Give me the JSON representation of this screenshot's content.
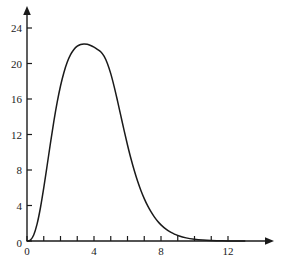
{
  "chart_data": {
    "type": "line",
    "title": "",
    "subtitle": "",
    "xlabel": "",
    "ylabel": "",
    "xlim": [
      0,
      13.5
    ],
    "ylim": [
      0,
      25.5
    ],
    "grid": false,
    "legend": null,
    "axis_style": {
      "x_axis_arrow": true,
      "y_axis_arrow": true,
      "spines": [
        "left",
        "bottom"
      ],
      "line_color": "#1a1a1a",
      "curve_color": "#1a1a1a",
      "background": "#ffffff"
    },
    "xticks": [
      0,
      1,
      2,
      3,
      4,
      5,
      6,
      7,
      8,
      9,
      10,
      11,
      12
    ],
    "xtick_labels": [
      "0",
      "",
      "",
      "",
      "4",
      "",
      "",
      "",
      "8",
      "",
      "",
      "",
      "12"
    ],
    "yticks": [
      0,
      4,
      8,
      12,
      16,
      20,
      24
    ],
    "ytick_labels": [
      "0",
      "4",
      "8",
      "12",
      "16",
      "20",
      "24"
    ],
    "series": [
      {
        "name": "curve",
        "peak_x": 3.5,
        "peak_y": 23.9,
        "x": [
          0.0,
          0.2,
          0.4,
          0.6,
          0.8,
          1.0,
          1.2,
          1.4,
          1.6,
          1.8,
          2.0,
          2.2,
          2.4,
          2.6,
          2.8,
          3.0,
          3.2,
          3.4,
          3.6,
          3.8,
          4.0,
          4.2,
          4.4,
          4.6,
          4.8,
          5.0,
          5.2,
          5.4,
          5.6,
          5.8,
          6.0,
          6.2,
          6.4,
          6.6,
          6.8,
          7.0,
          7.2,
          7.4,
          7.6,
          7.8,
          8.0,
          8.2,
          8.4,
          8.6,
          8.8,
          9.0,
          9.5,
          10.0,
          10.5,
          11.0,
          11.5,
          12.0,
          12.5,
          13.0
        ],
        "y": [
          0.0,
          0.1,
          0.68,
          1.9,
          3.72,
          5.98,
          8.48,
          11.02,
          13.44,
          15.61,
          17.46,
          18.96,
          20.13,
          20.99,
          21.58,
          21.95,
          22.15,
          22.2,
          22.16,
          22.03,
          21.84,
          21.6,
          21.32,
          20.83,
          20.01,
          18.86,
          17.43,
          15.82,
          14.12,
          12.43,
          10.82,
          9.32,
          7.97,
          6.76,
          5.7,
          4.78,
          3.98,
          3.3,
          2.72,
          2.23,
          1.82,
          1.48,
          1.2,
          0.97,
          0.78,
          0.62,
          0.35,
          0.19,
          0.1,
          0.05,
          0.03,
          0.01,
          0.01,
          0.0
        ]
      }
    ]
  },
  "figure": {
    "name": "probability-density-curve"
  }
}
